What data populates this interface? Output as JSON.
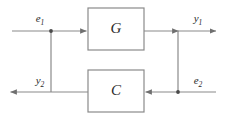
{
  "diagram": {
    "kind": "block-diagram",
    "background_color": "#ffffff",
    "line_color": "#8a8a8a",
    "text_color": "#2a2a2a",
    "blocks": [
      {
        "id": "G",
        "label": "G",
        "x": 88,
        "y": 8,
        "width": 56,
        "height": 42
      },
      {
        "id": "C",
        "label": "C",
        "x": 88,
        "y": 70,
        "width": 56,
        "height": 42
      }
    ],
    "signals": [
      {
        "id": "e1",
        "base": "e",
        "sub": "1",
        "x": 40,
        "y": 22
      },
      {
        "id": "y1",
        "base": "y",
        "sub": "1",
        "x": 198,
        "y": 22
      },
      {
        "id": "y2",
        "base": "y",
        "sub": "2",
        "x": 40,
        "y": 84
      },
      {
        "id": "e2",
        "base": "e",
        "sub": "2",
        "x": 198,
        "y": 84
      }
    ],
    "junctions": [
      {
        "id": "left-node",
        "x": 51,
        "y": 31
      },
      {
        "id": "right-node",
        "x": 178,
        "y": 92
      }
    ]
  }
}
